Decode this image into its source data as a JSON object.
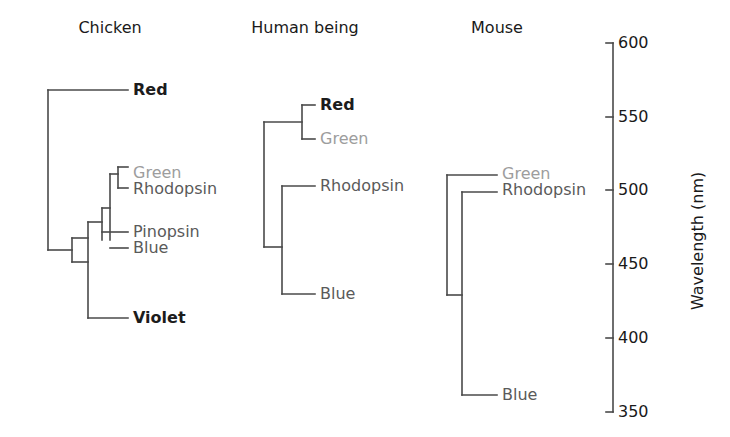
{
  "figure": {
    "width": 730,
    "height": 437,
    "background": "#ffffff",
    "line_color": "#4a4a4a"
  },
  "axis": {
    "name": "Wavelength (nm)",
    "unit": "nm",
    "orientation": "vertical",
    "direction": "600 at top to 350 at bottom",
    "ticks": [
      {
        "label": "600",
        "value": 600,
        "y": 43
      },
      {
        "label": "550",
        "value": 550,
        "y": 117
      },
      {
        "label": "500",
        "value": 500,
        "y": 190
      },
      {
        "label": "450",
        "value": 450,
        "y": 264
      },
      {
        "label": "400",
        "value": 400,
        "y": 338
      },
      {
        "label": "350",
        "value": 350,
        "y": 412
      }
    ],
    "line_x": 613,
    "tick_length": 7
  },
  "colors": {
    "leaf_dark": "#1c1c1c",
    "leaf_mid": "#5a5a5a",
    "leaf_light": "#9d9d9d",
    "branch": "#4a4a4a",
    "title": "#1a1a1a"
  },
  "chart_data": {
    "type": "diagram",
    "ylabel": "Wavelength (nm)",
    "ylim": [
      350,
      600
    ],
    "yticks": [
      350,
      400,
      450,
      500,
      550,
      600
    ],
    "note": "Vertical position of each leaf label encodes the pigment absorption maximum in nm.",
    "groups": [
      {
        "name": "Chicken",
        "leaves": [
          {
            "label": "Red",
            "wavelength": 571,
            "tone": "dark"
          },
          {
            "label": "Green",
            "wavelength": 508,
            "tone": "light"
          },
          {
            "label": "Rhodopsin",
            "wavelength": 503,
            "tone": "mid"
          },
          {
            "label": "Pinopsin",
            "wavelength": 470,
            "tone": "mid"
          },
          {
            "label": "Blue",
            "wavelength": 455,
            "tone": "mid"
          },
          {
            "label": "Violet",
            "wavelength": 415,
            "tone": "dark"
          }
        ]
      },
      {
        "name": "Human being",
        "leaves": [
          {
            "label": "Red",
            "wavelength": 560,
            "tone": "dark"
          },
          {
            "label": "Green",
            "wavelength": 530,
            "tone": "light"
          },
          {
            "label": "Rhodopsin",
            "wavelength": 498,
            "tone": "mid"
          },
          {
            "label": "Blue",
            "wavelength": 420,
            "tone": "mid"
          }
        ]
      },
      {
        "name": "Mouse",
        "leaves": [
          {
            "label": "Green",
            "wavelength": 508,
            "tone": "light"
          },
          {
            "label": "Rhodopsin",
            "wavelength": 498,
            "tone": "mid"
          },
          {
            "label": "Blue",
            "wavelength": 359,
            "tone": "mid"
          }
        ]
      }
    ]
  },
  "trees": {
    "chicken": {
      "title": "Chicken",
      "title_x": 110,
      "title_y": 18,
      "labels": [
        {
          "text": "Red",
          "x": 133,
          "y": 82,
          "tone": "dark"
        },
        {
          "text": "Green",
          "x": 133,
          "y": 165,
          "tone": "light"
        },
        {
          "text": "Rhodopsin",
          "x": 133,
          "y": 181,
          "tone": "mid"
        },
        {
          "text": "Pinopsin",
          "x": 133,
          "y": 224,
          "tone": "mid"
        },
        {
          "text": "Blue",
          "x": 133,
          "y": 240,
          "tone": "mid"
        },
        {
          "text": "Violet",
          "x": 133,
          "y": 310,
          "tone": "dark"
        }
      ],
      "paths": [
        "M 48 90 L 128 90",
        "M 48 90 L 48 250",
        "M 48 250 L 72 250",
        "M 72 238 L 72 262",
        "M 72 238 L 88 238",
        "M 72 262 L 88 262",
        "M 88 222 L 88 318",
        "M 88 318 L 128 318",
        "M 88 222 L 102 222",
        "M 102 208 L 102 240",
        "M 102 208 L 110 208",
        "M 110 174 L 110 240",
        "M 110 174 L 118 174",
        "M 118 167 L 118 188",
        "M 118 167 L 128 167",
        "M 118 188 L 128 188",
        "M 102 232 L 128 232",
        "M 110 248 L 128 248"
      ]
    },
    "human": {
      "title": "Human being",
      "title_x": 305,
      "title_y": 18,
      "labels": [
        {
          "text": "Red",
          "x": 320,
          "y": 97,
          "tone": "dark"
        },
        {
          "text": "Green",
          "x": 320,
          "y": 131,
          "tone": "light"
        },
        {
          "text": "Rhodopsin",
          "x": 320,
          "y": 178,
          "tone": "mid"
        },
        {
          "text": "Blue",
          "x": 320,
          "y": 286,
          "tone": "mid"
        }
      ],
      "paths": [
        "M 264 122 L 264 247",
        "M 264 122 L 302 122",
        "M 302 105 L 302 139",
        "M 302 105 L 315 105",
        "M 302 139 L 315 139",
        "M 264 247 L 282 247",
        "M 282 186 L 282 294",
        "M 282 186 L 315 186",
        "M 282 294 L 315 294"
      ]
    },
    "mouse": {
      "title": "Mouse",
      "title_x": 497,
      "title_y": 18,
      "labels": [
        {
          "text": "Green",
          "x": 502,
          "y": 166,
          "tone": "light"
        },
        {
          "text": "Rhodopsin",
          "x": 502,
          "y": 182,
          "tone": "mid"
        },
        {
          "text": "Blue",
          "x": 502,
          "y": 387,
          "tone": "mid"
        }
      ],
      "paths": [
        "M 447 175 L 447 295",
        "M 447 175 L 497 175",
        "M 447 295 L 462 295",
        "M 462 192 L 462 395",
        "M 462 192 L 497 192",
        "M 462 395 L 497 395"
      ]
    }
  }
}
